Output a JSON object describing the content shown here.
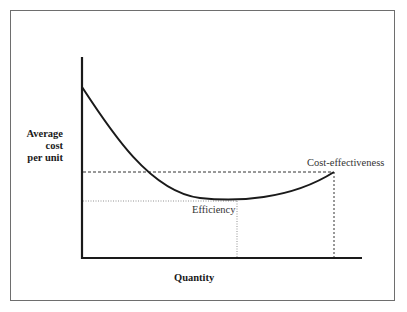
{
  "diagram": {
    "type": "average-cost-curve",
    "y_axis_label_lines": [
      "Average",
      "cost",
      "per unit"
    ],
    "x_axis_label": "Quantity",
    "annotations": {
      "efficiency": "Efficiency",
      "cost_effectiveness": "Cost-effectiveness"
    },
    "colors": {
      "axes": "#1a1a1a",
      "curve": "#1a1a1a",
      "guide_lines": "#333333",
      "frame": "#6e6e6e"
    }
  }
}
